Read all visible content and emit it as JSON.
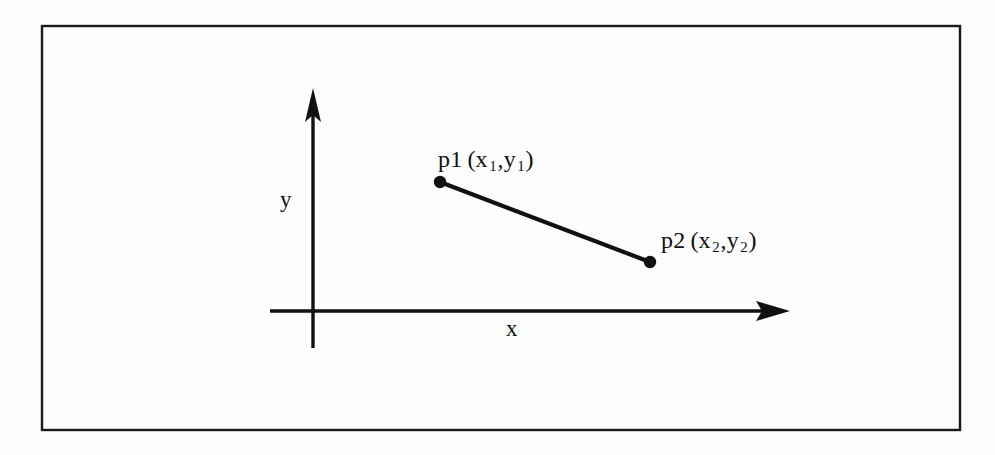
{
  "figure": {
    "name": "line-segment-between-two-points",
    "background_color": "#fdfdfd",
    "ink_color": "#111111",
    "border": {
      "present": true,
      "color": "#1a1a1a",
      "thickness_px": 2,
      "rect": {
        "x": 41,
        "y": 25,
        "width": 920,
        "height": 406
      }
    }
  },
  "axes": {
    "x": {
      "label": "x",
      "arrow": "right",
      "start": {
        "x": 270,
        "y": 311
      },
      "end": {
        "x": 790,
        "y": 311
      },
      "label_position": {
        "x": 513,
        "y": 330
      }
    },
    "y": {
      "label": "y",
      "arrow": "up",
      "start": {
        "x": 313,
        "y": 348
      },
      "end": {
        "x": 313,
        "y": 88
      },
      "label_position": {
        "x": 288,
        "y": 200
      }
    }
  },
  "points": [
    {
      "id": "p1",
      "name": "p1",
      "coord_x": "x",
      "coord_sub_x": "1",
      "coord_y": "y",
      "coord_sub_y": "1",
      "label_text": "p1 (x1,y1)",
      "dot": {
        "x": 440,
        "y": 182,
        "radius": 6
      },
      "label_position": {
        "x": 438,
        "y": 147
      }
    },
    {
      "id": "p2",
      "name": "p2",
      "coord_x": "x",
      "coord_sub_x": "2",
      "coord_y": "y",
      "coord_sub_y": "2",
      "label_text": "p2 (x2,y2)",
      "dot": {
        "x": 650,
        "y": 262,
        "radius": 6
      },
      "label_position": {
        "x": 661,
        "y": 228
      }
    }
  ],
  "segment": {
    "name": "line-segment-p1-p2",
    "from": "p1",
    "to": "p2",
    "thickness_px": 4
  },
  "labels": {
    "p1_prefix": "p1",
    "p2_prefix": "p2",
    "open_paren": "(",
    "close_paren": ")",
    "comma": ",",
    "x_symbol": "x",
    "y_symbol": "y",
    "sub_one": "1",
    "sub_two": "2"
  }
}
